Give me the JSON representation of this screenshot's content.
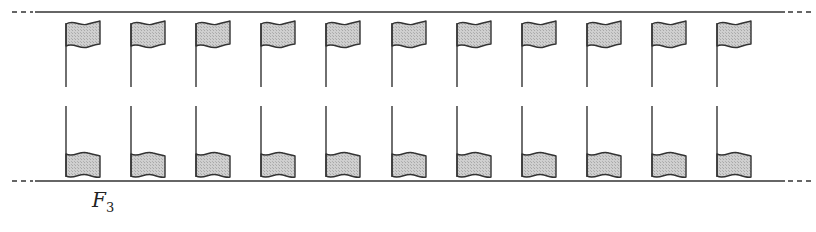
{
  "diagram": {
    "label": "F",
    "label_subscript": "3",
    "flag_count": 11,
    "flag_positions_x": [
      66,
      131,
      196,
      261,
      326,
      392,
      457,
      522,
      587,
      652,
      717
    ],
    "rows": [
      {
        "name": "top-row",
        "orientation": "upright",
        "flag_top": 22,
        "pole_bottom": 87
      },
      {
        "name": "bottom-row",
        "orientation": "reflected",
        "pole_top": 106,
        "flag_bottom": 178
      }
    ],
    "boundary_lines": {
      "top_y": 12,
      "bottom_y": 181,
      "solid_from": 35,
      "solid_to": 785
    },
    "colors": {
      "stroke": "#333333",
      "flag_fill": "#c8c8c8",
      "background": "#ffffff"
    }
  }
}
